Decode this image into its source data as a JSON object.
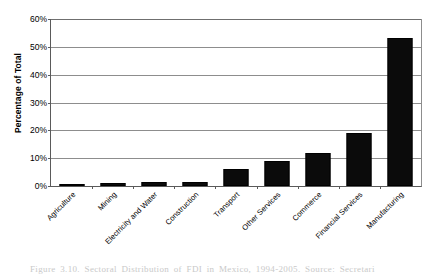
{
  "chart_data": {
    "type": "bar",
    "title": "",
    "xlabel": "",
    "ylabel": "Percentage of Total",
    "categories": [
      "Agriculture",
      "Mining",
      "Electricity and Water",
      "Construction",
      "Transport",
      "Other Services",
      "Commerce",
      "Financial Services",
      "Manufacturing"
    ],
    "values": [
      0.7,
      1.2,
      1.3,
      1.4,
      6.0,
      9.0,
      11.8,
      19.0,
      53.0
    ],
    "ylim": [
      0,
      60
    ],
    "yticks": [
      0,
      10,
      20,
      30,
      40,
      50,
      60
    ],
    "ytick_labels": [
      "0%",
      "10%",
      "20%",
      "30%",
      "40%",
      "50%",
      "60%"
    ],
    "grid": true,
    "legend": false,
    "bar_color": "#0b0b0b",
    "axis_color": "#5a5a5a",
    "gridline_color": "#8d8d8d"
  },
  "caption": {
    "text": "Figure 3.10. Sectoral Distribution of FDI in Mexico, 1994-2005. Source: Secretari"
  }
}
